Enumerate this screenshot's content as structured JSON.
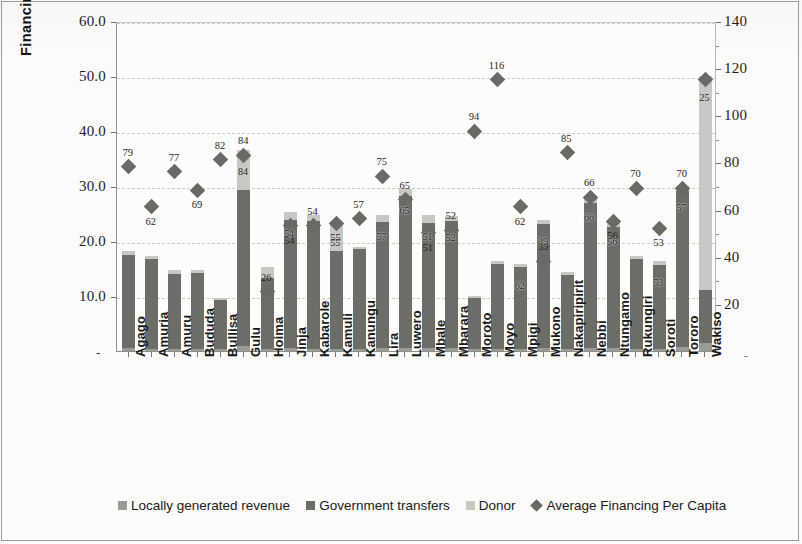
{
  "chart_data": {
    "type": "bar",
    "title": "",
    "subtitle": "",
    "ylabel": "Financing to districts UGX' Bn",
    "xlabel": "",
    "ylim": [
      0,
      60
    ],
    "y2lim": [
      0,
      140
    ],
    "ytick_labels": [
      "60.0",
      "50.0",
      "40.0",
      "30.0",
      "20.0",
      "10.0",
      "-"
    ],
    "ytick_values": [
      60,
      50,
      40,
      30,
      20,
      10,
      0
    ],
    "y2tick_labels": [
      "140",
      "120",
      "100",
      "80",
      "60",
      "40",
      "20",
      "-"
    ],
    "y2tick_values": [
      140,
      120,
      100,
      80,
      60,
      40,
      20,
      0
    ],
    "grid": true,
    "legend_position": "bottom",
    "stacked": true,
    "categories": [
      "Agago",
      "Amuria",
      "Amuru",
      "Bududa",
      "Bullisa",
      "Gulu",
      "Hoima",
      "Jinja",
      "Kabarole",
      "Kamuli",
      "Kanungu",
      "Lira",
      "Luwero",
      "Mbale",
      "Mbarara",
      "Moroto",
      "Moyo",
      "Mpigi",
      "Mukono",
      "Nakapiripirit",
      "Nebbi",
      "Ntungamo",
      "Rukungiri",
      "Soroti",
      "Tororo",
      "Wakiso"
    ],
    "series": [
      {
        "name": "Locally generated revenue",
        "color": "#9b9b95",
        "values": [
          0.5,
          0.4,
          0.4,
          0.3,
          0.3,
          1.0,
          0.4,
          0.5,
          0.4,
          0.4,
          0.3,
          0.5,
          0.6,
          0.5,
          0.5,
          0.3,
          0.4,
          0.4,
          0.6,
          0.3,
          0.6,
          0.5,
          0.4,
          0.4,
          0.7,
          1.4
        ]
      },
      {
        "name": "Government transfers",
        "color": "#6d6d68",
        "values": [
          17.0,
          16.4,
          13.6,
          13.9,
          9.0,
          28.3,
          12.8,
          23.3,
          23.3,
          17.8,
          18.3,
          23.0,
          27.5,
          22.8,
          23.2,
          9.4,
          15.4,
          14.9,
          22.5,
          13.5,
          26.4,
          22.0,
          16.3,
          15.3,
          28.4,
          9.7
        ]
      },
      {
        "name": "Donor",
        "color": "#c8c8c2",
        "values": [
          0.7,
          0.5,
          0.8,
          0.5,
          0.3,
          7.3,
          2.1,
          1.5,
          1.0,
          5.4,
          0.3,
          1.3,
          1.4,
          1.5,
          0.8,
          0.3,
          0.5,
          0.6,
          0.8,
          0.6,
          1.2,
          1.3,
          0.5,
          0.6,
          0.9,
          38.9
        ]
      }
    ],
    "marker_series": {
      "name": "Average Financing Per Capita",
      "color": "#6a6a65",
      "axis": "right",
      "values": [
        79,
        62,
        77,
        69,
        82,
        84,
        26,
        54,
        54,
        55,
        57,
        75,
        65,
        51,
        52,
        94,
        116,
        62,
        39,
        85,
        66,
        56,
        70,
        53,
        70,
        116
      ]
    },
    "marker_labels": [
      "79",
      "62",
      "77",
      "69",
      "82",
      "84",
      "26",
      "54",
      "54",
      "55",
      "57",
      "75",
      "65",
      "51",
      "52",
      "94",
      "116",
      "62",
      "39",
      "85",
      "66",
      "56",
      "70",
      "53",
      "70",
      ""
    ],
    "bar_labels": [
      "",
      "",
      "",
      "",
      "",
      "84",
      "",
      "54",
      "",
      "55",
      "",
      "57",
      "65",
      "51",
      "52",
      "",
      "",
      "62",
      "39",
      "",
      "66",
      "56",
      "",
      "53",
      "57",
      "25"
    ]
  },
  "legend": {
    "items": [
      {
        "label": "Locally generated revenue",
        "swatch": "square",
        "color": "#9b9b95"
      },
      {
        "label": "Government transfers",
        "swatch": "square",
        "color": "#6d6d68"
      },
      {
        "label": "Donor",
        "swatch": "square",
        "color": "#c8c8c2"
      },
      {
        "label": "Average Financing Per Capita",
        "swatch": "diamond",
        "color": "#6a6a65"
      }
    ]
  },
  "axis": {
    "left_zero_label": "-",
    "right_zero_label": "-"
  }
}
